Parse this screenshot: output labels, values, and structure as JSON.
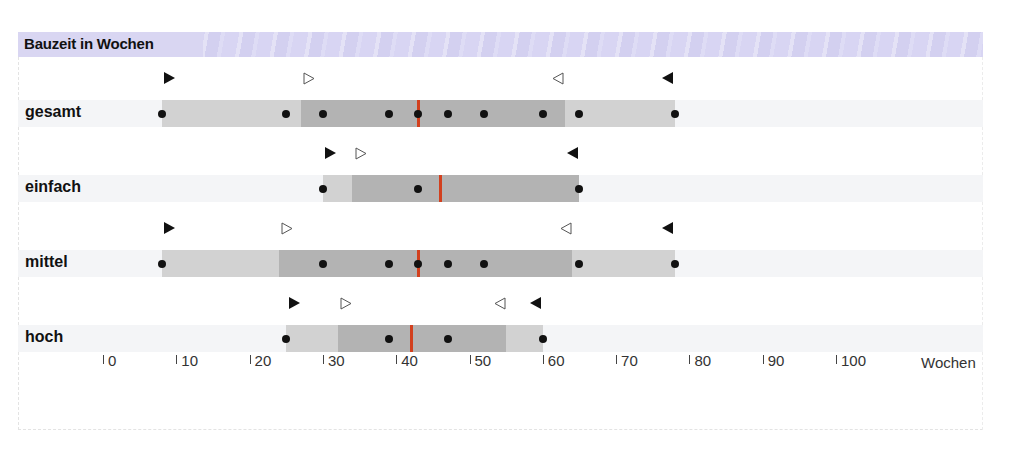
{
  "chart_data": {
    "type": "boxplot-range",
    "title": "Bauzeit in Wochen",
    "xlabel": "Wochen",
    "xlim": [
      0,
      100
    ],
    "x_ticks": [
      0,
      10,
      20,
      30,
      40,
      50,
      60,
      70,
      80,
      90,
      100
    ],
    "legend": [],
    "grid": false,
    "series": [
      {
        "name": "gesamt",
        "range": [
          8,
          78
        ],
        "inner_range": [
          27,
          63
        ],
        "median": 43,
        "points": [
          8,
          25,
          30,
          39,
          43,
          47,
          52,
          60,
          65,
          78
        ],
        "markers": {
          "filled_right": 9,
          "hollow_right": 28,
          "hollow_left": 62,
          "filled_left": 77
        }
      },
      {
        "name": "einfach",
        "range": [
          30,
          65
        ],
        "inner_range": [
          34,
          65
        ],
        "median": 46,
        "points": [
          30,
          43,
          65
        ],
        "markers": {
          "filled_right": 31,
          "hollow_right": 35,
          "filled_left": 64
        }
      },
      {
        "name": "mittel",
        "range": [
          8,
          78
        ],
        "inner_range": [
          24,
          64
        ],
        "median": 43,
        "points": [
          8,
          30,
          39,
          43,
          47,
          52,
          65,
          78
        ],
        "markers": {
          "filled_right": 9,
          "hollow_right": 25,
          "hollow_left": 63,
          "filled_left": 77
        }
      },
      {
        "name": "hoch",
        "range": [
          25,
          60
        ],
        "inner_range": [
          32,
          55
        ],
        "median": 42,
        "points": [
          25,
          39,
          47,
          60
        ],
        "markers": {
          "filled_right": 26,
          "hollow_right": 33,
          "hollow_left": 54,
          "filled_left": 59
        }
      }
    ]
  },
  "header": {
    "title": "Bauzeit in Wochen"
  },
  "axis": {
    "unit": "Wochen",
    "tick_labels": [
      "0",
      "10",
      "20",
      "30",
      "40",
      "50",
      "60",
      "70",
      "80",
      "90",
      "100"
    ]
  },
  "rows": [
    {
      "label": "gesamt"
    },
    {
      "label": "einfach"
    },
    {
      "label": "mittel"
    },
    {
      "label": "hoch"
    }
  ],
  "colors": {
    "light_bar": "#d2d2d2",
    "dark_bar": "#b3b3b3",
    "median": "#d2401e",
    "header_band": "#d9d6f2",
    "row_band": "#f4f5f7"
  }
}
